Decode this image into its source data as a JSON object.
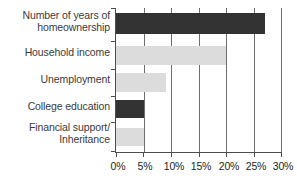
{
  "chart_data": {
    "type": "bar",
    "orientation": "horizontal",
    "title": "",
    "xlabel": "",
    "ylabel": "",
    "categories": [
      "Number of years of\nhomeownership",
      "Household income",
      "Unemployment",
      "College education",
      "Financial support/\nInheritance"
    ],
    "values": [
      27,
      20,
      9,
      5,
      5
    ],
    "value_labels": [
      "27%",
      "20%",
      "9%",
      "5%",
      "5%"
    ],
    "bar_colors": [
      "#333333",
      "#dcdcdc",
      "#dcdcdc",
      "#333333",
      "#dcdcdc"
    ],
    "xlim": [
      0,
      30
    ],
    "xticks": [
      0,
      5,
      10,
      15,
      20,
      25,
      30
    ],
    "xtick_labels": [
      "0%",
      "5%",
      "10%",
      "15%",
      "20%",
      "25%",
      "30%"
    ],
    "grid": true,
    "grid_axis": "x",
    "legend": null
  },
  "axis": {
    "tick_labels": [
      "0%",
      "5%",
      "10%",
      "15%",
      "20%",
      "25%",
      "30%"
    ]
  },
  "colors": {
    "dark_bar": "#333333",
    "light_bar": "#dcdcdc",
    "axis": "#4d4d4d",
    "grid": "#6e6e6e",
    "text": "#231f20",
    "background": "#ffffff"
  }
}
